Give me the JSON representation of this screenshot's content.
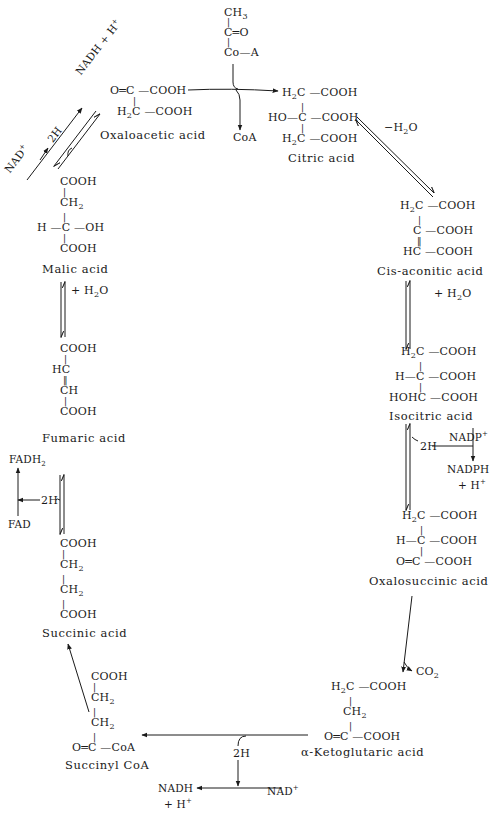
{
  "diagram": {
    "colors": {
      "ink": "#1a1a1a",
      "background": "#ffffff"
    },
    "acetyl_coa": {
      "lines": [
        "CH3",
        "C=O",
        "Co-A"
      ],
      "html": {
        "l0": "CH",
        "l0sub": "3",
        "l1": "C═O",
        "l2": "Co—A"
      }
    },
    "molecules": {
      "oxaloacetic": {
        "name": "Oxaloacetic acid",
        "r1": "O═C —COOH",
        "r2": "H",
        "r2sub": "2",
        "r2b": "C —COOH"
      },
      "citric": {
        "name": "Citric acid",
        "r1a": "H",
        "r1sub": "2",
        "r1b": "C —COOH",
        "r2": "HO—C —COOH",
        "r3a": "H",
        "r3sub": "2",
        "r3b": "C —COOH"
      },
      "cis_aconitic": {
        "name": "Cis-aconitic acid",
        "r1a": "H",
        "r1sub": "2",
        "r1b": "C —COOH",
        "r2": "C —COOH",
        "r3": "HC —COOH"
      },
      "isocitric": {
        "name": "Isocitric acid",
        "r1a": "H",
        "r1sub": "2",
        "r1b": "C —COOH",
        "r2": "H—C —COOH",
        "r3": "HOHC —COOH"
      },
      "oxalosuccinic": {
        "name": "Oxalosuccinic acid",
        "r1a": "H",
        "r1sub": "2",
        "r1b": "C —COOH",
        "r2": "H—C —COOH",
        "r3": "O═C —COOH"
      },
      "alpha_ketoglutaric": {
        "name": "α-Ketoglutaric acid",
        "r1a": "H",
        "r1sub": "2",
        "r1b": "C —COOH",
        "r2": "CH",
        "r2sub": "2",
        "r3": "O═C —COOH"
      },
      "succinyl_coa": {
        "name": "Succinyl CoA",
        "r1": "COOH",
        "r2": "CH",
        "r2sub": "2",
        "r3": "CH",
        "r3sub": "2",
        "r4": "O═C —CoA"
      },
      "succinic": {
        "name": "Succinic acid",
        "r1": "COOH",
        "r2": "CH",
        "r2sub": "2",
        "r3": "CH",
        "r3sub": "2",
        "r4": "COOH"
      },
      "fumaric": {
        "name": "Fumaric acid",
        "r1": "COOH",
        "r2": "HC",
        "r3": "CH",
        "r4": "COOH"
      },
      "malic": {
        "name": "Malic acid",
        "r1": "COOH",
        "r2": "CH",
        "r2sub": "2",
        "r3": "H —C —OH",
        "r4": "COOH"
      }
    },
    "cofactors": {
      "coa_release": "CoA",
      "minus_h2o": "−H",
      "minus_h2o_sub": "2",
      "minus_h2o_tail": "O",
      "plus_h2o_right": "+ H",
      "plus_h2o_right_sub": "2",
      "plus_h2o_right_tail": "O",
      "plus_h2o_left": "+ H",
      "plus_h2o_left_sub": "2",
      "plus_h2o_left_tail": "O",
      "nadp": "NADP",
      "nadp_sup": "+",
      "nadph": "NADPH",
      "nadph_h": "+ H",
      "nadph_h_sup": "+",
      "two_h_right": "2H",
      "co2": "CO",
      "co2_sub": "2",
      "two_h_bottom": "2H",
      "nad_bottom": "NAD",
      "nad_bottom_sup": "+",
      "nadh_bottom": "NADH",
      "nadh_bottom_h": "+ H",
      "nadh_bottom_h_sup": "+",
      "fadh2": "FADH",
      "fadh2_sub": "2",
      "fad": "FAD",
      "two_h_left": "2H",
      "nad_top": "NAD",
      "nad_top_sup": "+",
      "nadh_top": "NADH + H",
      "nadh_top_sup": "+",
      "two_h_top": "2H"
    }
  }
}
